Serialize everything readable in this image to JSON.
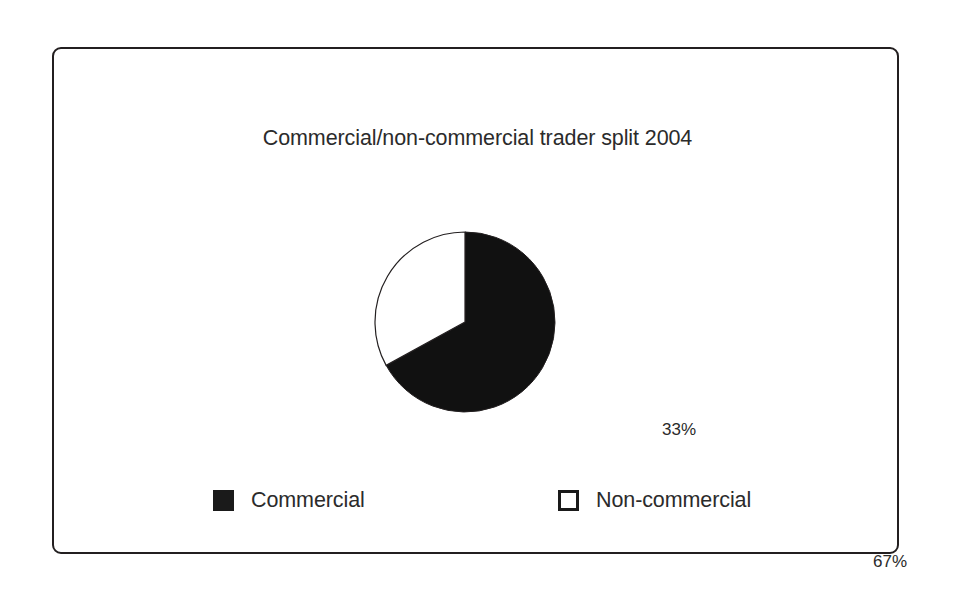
{
  "figure": {
    "background_color": "#ffffff",
    "frame_border_color": "#231f20"
  },
  "chart_data": {
    "type": "pie",
    "title": "Commercial/non-commercial trader split 2004",
    "xlabel": "",
    "ylabel": "",
    "categories": [
      "Commercial",
      "Non-commercial"
    ],
    "values": [
      67,
      33
    ],
    "value_labels": [
      "67%",
      "33%"
    ],
    "unit": "%",
    "colors": [
      "#111111",
      "#ffffff"
    ],
    "slice_outline_color": "#231f20",
    "start_angle_deg": 0,
    "direction": "clockwise",
    "grid": false,
    "legend_position": "bottom",
    "legend": [
      {
        "label": "Commercial",
        "swatch": "filled",
        "color": "#111111"
      },
      {
        "label": "Non-commercial",
        "swatch": "hollow",
        "color": "#ffffff"
      }
    ],
    "annotations": [
      {
        "name": "commercial-percent",
        "text": "67%",
        "slice": "Commercial"
      },
      {
        "name": "noncommercial-percent",
        "text": "33%",
        "slice": "Non-commercial"
      }
    ]
  }
}
